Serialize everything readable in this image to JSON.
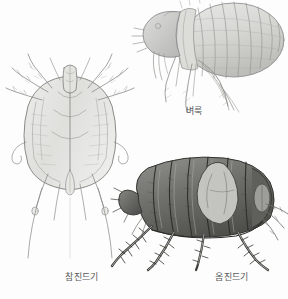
{
  "plate": {
    "title": "Parasitic arthropods illustration plate",
    "background_color": "#fdfdfd",
    "caption_color": "#585858",
    "medium": "pencil / stipple scientific illustration",
    "figure_count": 3
  },
  "figures": [
    {
      "id": "flea",
      "label": "벼룩",
      "english": "flea",
      "position": "top-right",
      "view": "lateral, facing left",
      "tone": "light graphite",
      "icon": "flea-illustration"
    },
    {
      "id": "tick",
      "label": "참진드기",
      "english": "hard tick",
      "position": "left",
      "view": "dorsal, legs radiating",
      "tone": "fine line art",
      "icon": "tick-illustration"
    },
    {
      "id": "mite",
      "label": "옴진드기",
      "english": "scabies mite",
      "position": "bottom-right",
      "view": "lateral, facing left",
      "tone": "dark shaded",
      "icon": "scabies-mite-illustration"
    }
  ]
}
